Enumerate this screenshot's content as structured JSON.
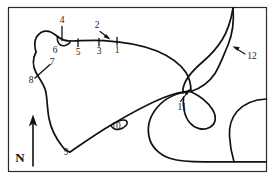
{
  "figure": {
    "kind": "hand-drawn-sketch-map",
    "background_color": "#ffffff",
    "ink_color": "#111111",
    "frame": {
      "color": "#2b2b2b",
      "x": 8,
      "y": 7,
      "width": 259,
      "height": 165
    }
  },
  "north_arrow": {
    "label": "N",
    "label_x": 20,
    "label_y": 159,
    "stem_x": 33,
    "stem_top": 118,
    "stem_bottom": 166
  },
  "annotations": [
    {
      "id": "1",
      "label": "1",
      "label_x": 117,
      "label_y": 51,
      "marker": "tick",
      "tick": {
        "x1": 117,
        "y1": 36,
        "x2": 117,
        "y2": 44
      }
    },
    {
      "id": "2",
      "label": "2",
      "label_x": 97,
      "label_y": 27,
      "marker": "arrow",
      "arrow": {
        "x1": 99,
        "y1": 32,
        "x2": 106,
        "y2": 38
      }
    },
    {
      "id": "3",
      "label": "3",
      "label_x": 99,
      "label_y": 51,
      "marker": "tick",
      "tick": {
        "x1": 99,
        "y1": 37,
        "x2": 99,
        "y2": 45
      }
    },
    {
      "id": "4",
      "label": "4",
      "label_x": 62,
      "label_y": 22,
      "marker": "tick",
      "tick": {
        "x1": 62,
        "y1": 27,
        "x2": 62,
        "y2": 40
      }
    },
    {
      "id": "5",
      "label": "5",
      "label_x": 78,
      "label_y": 52,
      "marker": "tick",
      "tick": {
        "x1": 78,
        "y1": 38,
        "x2": 78,
        "y2": 46
      }
    },
    {
      "id": "6",
      "label": "6",
      "label_x": 55,
      "label_y": 49,
      "marker": "bay-loop"
    },
    {
      "id": "7",
      "label": "7",
      "label_x": 51,
      "label_y": 65,
      "marker": "cross-tick",
      "tick": {
        "x1": 37,
        "y1": 77,
        "x2": 49,
        "y2": 65
      }
    },
    {
      "id": "8",
      "label": "8",
      "label_x": 32,
      "label_y": 80,
      "marker": "cross-tick-end"
    },
    {
      "id": "9",
      "label": "9",
      "label_x": 66,
      "label_y": 152,
      "marker": "point"
    },
    {
      "id": "10",
      "label": "10",
      "label_x": 115,
      "label_y": 126,
      "marker": "loop"
    },
    {
      "id": "11",
      "label": "11",
      "label_x": 182,
      "label_y": 107,
      "marker": "arrow",
      "arrow": {
        "x1": 180,
        "y1": 102,
        "x2": 190,
        "y2": 89
      }
    },
    {
      "id": "12",
      "label": "12",
      "label_x": 251,
      "label_y": 57,
      "marker": "arrow",
      "arrow": {
        "x1": 246,
        "y1": 54,
        "x2": 235,
        "y2": 47
      }
    }
  ],
  "features": {
    "coastline_main": "M 231,8 C 233,22 230,32 224,41 C 218,50 211,57 204,62 C 196,68 190,73 186,80 C 184,84 183,88 183,92",
    "north_shore": "M 36,51 C 34,42 36,36 41,33 C 47,30 53,33 58,37 C 62,40 66,41 70,41 C 78,41 92,40 104,41 C 124,42 142,45 157,51 C 170,56 180,63 186,72 C 190,78 192,85 191,92",
    "west_shore": "M 36,51 C 33,58 33,65 36,72 C 39,79 43,83 45,90 C 47,98 47,108 49,118 C 51,128 56,138 62,146 C 65,150 68,152 70,152",
    "south_diagonal": "M 70,152 C 84,142 98,132 112,124 C 128,115 146,104 164,97 C 173,93 182,91 190,91",
    "bay6": "M 58,37 C 57,42 60,46 65,45 C 69,44 71,41 70,41",
    "loop10": "M 112,124 C 118,121 124,119 126,121 C 128,124 124,128 119,129 C 115,130 112,127 112,124",
    "east_lobe": "M 191,92 C 200,89 209,83 215,74 C 221,64 224,53 228,44 C 232,34 237,24 240,14",
    "inner_loop": "M 190,91 C 198,95 207,101 212,109 C 216,116 215,123 209,127 C 203,131 195,129 190,124 C 184,118 182,108 183,98",
    "south_loop": "M 190,91 C 178,92 166,97 158,106 C 150,115 147,126 149,136 C 151,147 159,155 170,159 C 180,162 192,162 204,162 C 222,162 243,162 266,162",
    "right_edge_tail": "M 266,99 C 255,99 244,103 237,111 C 231,118 229,126 229,134"
  }
}
